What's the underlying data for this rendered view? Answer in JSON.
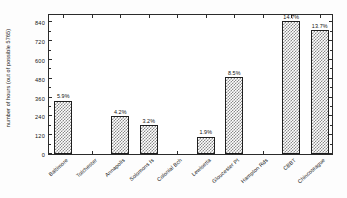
{
  "chart_data": {
    "type": "bar",
    "title": "",
    "xlabel": "",
    "ylabel": "number of hours (out of possible 5765)",
    "ylim": [
      0,
      900
    ],
    "yticks": [
      0,
      120,
      240,
      360,
      480,
      600,
      720,
      840
    ],
    "ytick_labels": [
      "0",
      "120",
      "240",
      "360",
      "480",
      "600",
      "720",
      "840"
    ],
    "grid": false,
    "legend": null,
    "categories": [
      "Baltimore",
      "Tolchester",
      "Annapolis",
      "Solomons Is",
      "Colonial Bch",
      "Lewisetta",
      "Gloucester Pt",
      "Hampton Rds",
      "CBBT",
      "Chincoteague"
    ],
    "values": [
      340,
      0,
      242,
      184,
      0,
      110,
      490,
      0,
      847,
      790
    ],
    "data_labels": [
      "5.9%",
      "",
      "4.2%",
      "3.2%",
      "",
      "1.9%",
      "8.5%",
      "",
      "14.7%",
      "13.7%"
    ],
    "bar_fill": "#8a8a8a",
    "bar_edge": "#1f1f1f",
    "axis_color": "#2b2b2b",
    "background": "#ffffff"
  }
}
